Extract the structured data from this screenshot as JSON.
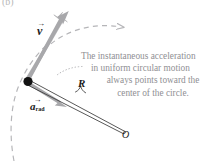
{
  "figure": {
    "panel_letter": "(b)",
    "type": "physics-diagram-uniform-circular-motion",
    "caption_lines": [
      "The instantaneous acceleration",
      "in uniform circular motion",
      "always points toward the",
      "center of the circle."
    ],
    "caption_full": "The instantaneous acceleration in uniform circular motion always points toward the center of the circle."
  },
  "labels": {
    "velocity": {
      "symbol": "v",
      "subscript": "",
      "arrow": "→",
      "text": "v"
    },
    "acceleration": {
      "symbol": "a",
      "subscript": "rad",
      "arrow": "→",
      "text": "a"
    },
    "radius": "R",
    "center": "O"
  },
  "colors": {
    "vector_gray": "#a8a8ab",
    "vector_gray_dark": "#9a9a9e",
    "circle_dashed": "#b5b5b8",
    "radius_line": "#3a3a3a",
    "particle_dot": "#121212",
    "caption_text": "#8f8f93",
    "leader_dotted": "#b5b5b8",
    "background": "#ffffff"
  },
  "geometry": {
    "particle_point": [
      28,
      81
    ],
    "center_point": [
      124,
      133
    ],
    "velocity_tip": [
      70,
      17
    ],
    "acceleration_tip": [
      66,
      106
    ],
    "motion_arrow_tip": [
      124,
      27
    ]
  }
}
